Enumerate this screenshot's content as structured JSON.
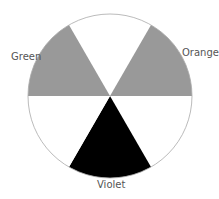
{
  "diagram": {
    "type": "color-wheel",
    "center": [
      110,
      96
    ],
    "radius": 82,
    "outline_color": "#aaaaaa",
    "sectors": [
      {
        "name": "top",
        "start_deg": -30,
        "end_deg": 30,
        "fill": "#ffffff",
        "label": ""
      },
      {
        "name": "orange",
        "start_deg": 30,
        "end_deg": 90,
        "fill": "#999999",
        "label": "Orange"
      },
      {
        "name": "lower-right",
        "start_deg": 90,
        "end_deg": 150,
        "fill": "#ffffff",
        "label": ""
      },
      {
        "name": "violet",
        "start_deg": 150,
        "end_deg": 210,
        "fill": "#000000",
        "label": "Violet"
      },
      {
        "name": "lower-left",
        "start_deg": 210,
        "end_deg": 270,
        "fill": "#ffffff",
        "label": ""
      },
      {
        "name": "green",
        "start_deg": 270,
        "end_deg": 330,
        "fill": "#999999",
        "label": "Green"
      }
    ],
    "labels": {
      "green": "Green",
      "orange": "Orange",
      "violet": "Violet"
    }
  }
}
